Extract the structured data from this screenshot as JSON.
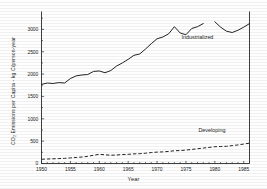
{
  "chart_data": {
    "type": "line",
    "title": "",
    "xlabel": "Year",
    "ylabel": "CO₂ Emissions per Capita - kg C/person-year",
    "xlim": [
      1950,
      1986
    ],
    "ylim": [
      0,
      3400
    ],
    "xticks": [
      1950,
      1955,
      1960,
      1965,
      1970,
      1975,
      1980,
      1985
    ],
    "xticklabels": [
      "1950",
      "1955",
      "1960",
      "1965",
      "1970",
      "1975",
      "1980",
      "1985"
    ],
    "yticks": [
      0,
      500,
      1000,
      1500,
      2000,
      2500,
      3000
    ],
    "yticklabels": [
      "0",
      "500",
      "1000",
      "1500",
      "2000",
      "2500",
      "3000"
    ],
    "grid": false,
    "legend_position": "inline-annotations",
    "annotations": [
      {
        "text": "Industrialized",
        "x": 1977.0,
        "y": 2780
      },
      {
        "text": "Developing",
        "x": 1979.5,
        "y": 700
      }
    ],
    "series": [
      {
        "name": "Industrialized",
        "style": "solid",
        "color": "#232323",
        "x": [
          1950,
          1951,
          1952,
          1953,
          1954,
          1955,
          1956,
          1957,
          1958,
          1959,
          1960,
          1961,
          1962,
          1963,
          1964,
          1965,
          1966,
          1967,
          1968,
          1969,
          1970,
          1971,
          1972,
          1973,
          1974,
          1975,
          1976,
          1977,
          1978,
          1980,
          1981,
          1982,
          1983,
          1984,
          1985,
          1986
        ],
        "y": [
          1770,
          1800,
          1790,
          1810,
          1800,
          1900,
          1960,
          1980,
          1990,
          2060,
          2070,
          2030,
          2080,
          2180,
          2250,
          2330,
          2420,
          2450,
          2560,
          2680,
          2790,
          2830,
          2900,
          3060,
          2920,
          2880,
          3020,
          3060,
          3130,
          3170,
          3050,
          2960,
          2930,
          2980,
          3050,
          3130
        ],
        "gap_after_year": 1978
      },
      {
        "name": "Developing",
        "style": "dashed",
        "color": "#232323",
        "x": [
          1950,
          1951,
          1952,
          1953,
          1954,
          1955,
          1956,
          1957,
          1958,
          1959,
          1960,
          1961,
          1962,
          1963,
          1964,
          1965,
          1966,
          1967,
          1968,
          1969,
          1970,
          1971,
          1972,
          1973,
          1974,
          1975,
          1976,
          1977,
          1978,
          1979,
          1980,
          1981,
          1982,
          1983,
          1984,
          1985,
          1986
        ],
        "y": [
          95,
          100,
          105,
          110,
          115,
          125,
          135,
          145,
          160,
          185,
          205,
          195,
          185,
          190,
          200,
          205,
          215,
          220,
          230,
          245,
          255,
          260,
          270,
          285,
          290,
          300,
          315,
          330,
          345,
          360,
          375,
          380,
          385,
          400,
          415,
          435,
          455
        ]
      }
    ]
  },
  "figure": {
    "caption": "",
    "x_axis_label": "Year",
    "y_axis_label": "CO₂ Emissions per Capita - kg C/person-year"
  }
}
